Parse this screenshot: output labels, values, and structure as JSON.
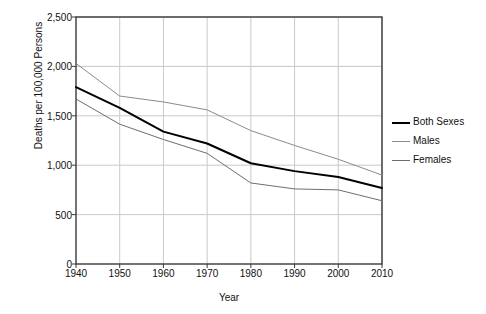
{
  "chart_data": {
    "type": "line",
    "title": "",
    "xlabel": "Year",
    "ylabel": "Deaths per 100,000 Persons",
    "x": [
      1940,
      1950,
      1960,
      1970,
      1980,
      1990,
      2000,
      2010
    ],
    "xticklabels": [
      "1940",
      "1950",
      "1960",
      "1970",
      "1980",
      "1990",
      "2000",
      "2010"
    ],
    "yticks": [
      0,
      500,
      1000,
      1500,
      2000,
      2500
    ],
    "yticklabels": [
      "0",
      "500",
      "1,000",
      "1,500",
      "2,000",
      "2,500"
    ],
    "ylim": [
      0,
      2500
    ],
    "xlim": [
      1940,
      2010
    ],
    "grid": true,
    "legend_position": "right",
    "series": [
      {
        "name": "Both Sexes",
        "color": "#000000",
        "width": 2,
        "values": [
          1790,
          1580,
          1340,
          1220,
          1020,
          940,
          880,
          770
        ]
      },
      {
        "name": "Males",
        "color": "#8a8a8a",
        "width": 1,
        "values": [
          2030,
          1700,
          1640,
          1560,
          1350,
          1200,
          1060,
          900
        ]
      },
      {
        "name": "Females",
        "color": "#6e6e6e",
        "width": 1,
        "values": [
          1670,
          1415,
          1260,
          1120,
          820,
          760,
          750,
          640
        ]
      }
    ]
  },
  "legend": {
    "items": [
      {
        "label": "Both Sexes"
      },
      {
        "label": "Males"
      },
      {
        "label": "Females"
      }
    ]
  }
}
